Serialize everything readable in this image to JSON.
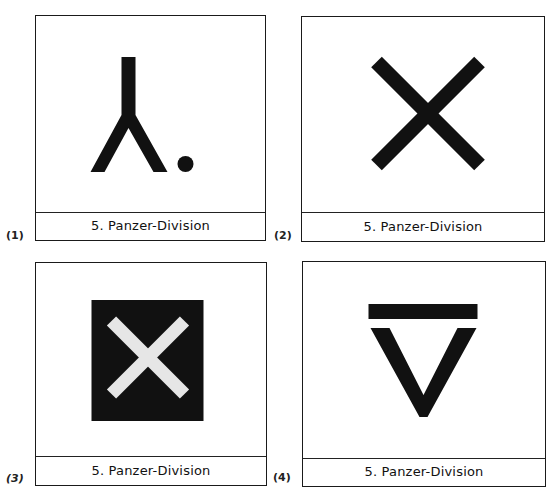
{
  "panels": [
    {
      "number": "(1)",
      "label": "5. Panzer-Division",
      "symbol": "inverted-y-with-dot"
    },
    {
      "number": "(2)",
      "label": "5. Panzer-Division",
      "symbol": "x-cross"
    },
    {
      "number": "(3)",
      "label": "5. Panzer-Division",
      "symbol": "light-x-on-dark-square"
    },
    {
      "number": "(4)",
      "label": "5. Panzer-Division",
      "symbol": "bar-over-v"
    }
  ],
  "colors": {
    "ink": "#111111",
    "paper": "#ffffff",
    "cross_light": "#e6e6e6"
  }
}
